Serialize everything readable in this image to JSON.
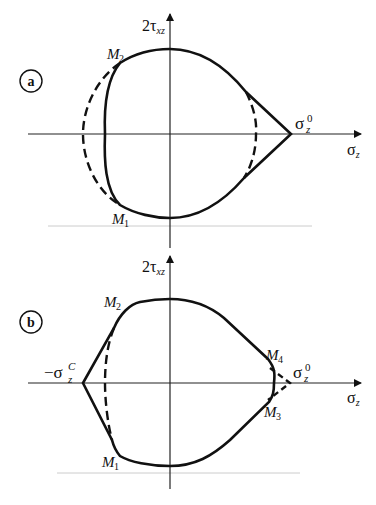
{
  "panels": [
    {
      "tag": "a",
      "y_axis_label": {
        "main": "2τ",
        "sub": "xz"
      },
      "x_axis_label": {
        "main": "σ",
        "sub": "z"
      },
      "tip_label": {
        "main": "σ",
        "sub": "z",
        "sup": "0"
      },
      "points": [
        {
          "name": "M",
          "sub": "2"
        },
        {
          "name": "M",
          "sub": "1"
        }
      ]
    },
    {
      "tag": "b",
      "y_axis_label": {
        "main": "2τ",
        "sub": "xz"
      },
      "x_axis_label": {
        "main": "σ",
        "sub": "z"
      },
      "tip_label": {
        "main": "σ",
        "sub": "z",
        "sup": "0"
      },
      "left_tip_label": {
        "prefix": "−σ",
        "sub": "z",
        "sup": "C"
      },
      "points": [
        {
          "name": "M",
          "sub": "2"
        },
        {
          "name": "M",
          "sub": "1"
        },
        {
          "name": "M",
          "sub": "4"
        },
        {
          "name": "M",
          "sub": "3"
        }
      ]
    }
  ],
  "colors": {
    "stroke": "#111111",
    "axis": "#222222",
    "baseline": "#cccccc"
  }
}
